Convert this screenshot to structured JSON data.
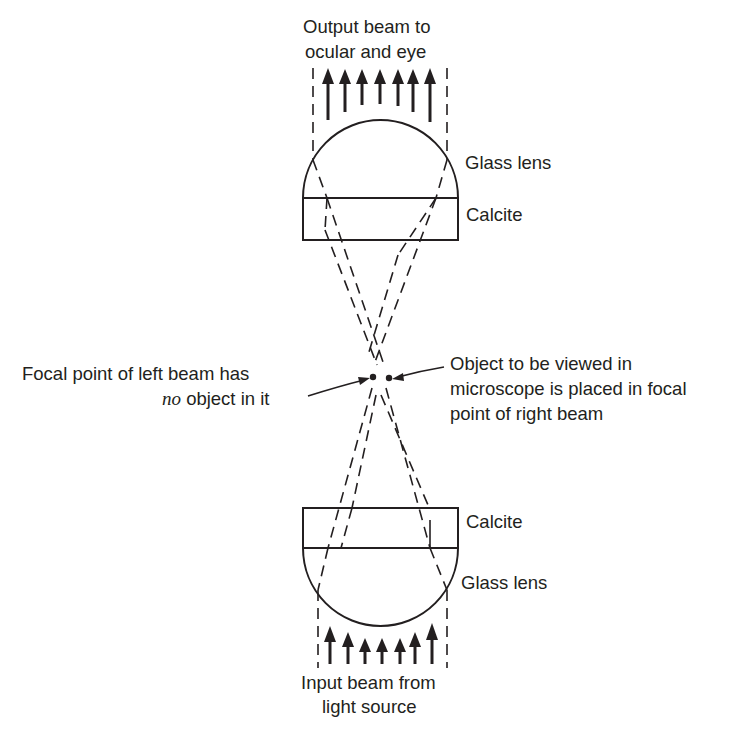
{
  "diagram": {
    "type": "optical-ray-diagram",
    "labels": {
      "output_beam": [
        "Output beam to",
        "ocular and eye"
      ],
      "top_lens": "Glass lens",
      "top_calcite": "Calcite",
      "left_focal": {
        "line1": "Focal point of left beam has",
        "line2_italic": "no",
        "line2_rest": " object in it"
      },
      "right_focal": [
        "Object to be viewed in",
        "microscope is placed in focal",
        "point of right beam"
      ],
      "bottom_calcite": "Calcite",
      "bottom_lens": "Glass lens",
      "input_beam": [
        "Input beam from",
        "light source"
      ]
    },
    "components": [
      {
        "name": "top-glass-lens",
        "shape": "hemisphere",
        "orientation": "dome-up"
      },
      {
        "name": "top-calcite-plate",
        "shape": "rectangle"
      },
      {
        "name": "bottom-calcite-plate",
        "shape": "rectangle"
      },
      {
        "name": "bottom-glass-lens",
        "shape": "hemisphere",
        "orientation": "dome-down"
      }
    ],
    "output_arrows": 7,
    "input_arrows": 7,
    "focal_points": [
      "left-beam-focal-point",
      "right-beam-focal-point"
    ],
    "colors": {
      "ink": "#231f20",
      "background": "#ffffff"
    }
  }
}
